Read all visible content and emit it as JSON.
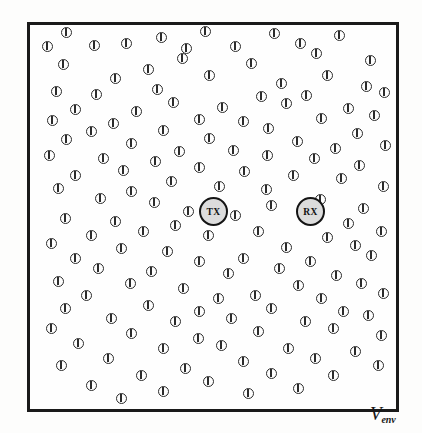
{
  "figure": {
    "name": "molecular-communication-environment-diagram",
    "background_color": "#fdfdfc",
    "box": {
      "border_color": "#1a1a1a",
      "fill_color": "#fefefe",
      "x": 27,
      "y": 22,
      "width": 372,
      "height": 390
    }
  },
  "labels": {
    "volume_symbol": "V",
    "volume_subscript": "env"
  },
  "nodes": [
    {
      "id": "tx",
      "label": "TX",
      "x": 196,
      "y": 194,
      "diameter": 29,
      "fill": "#dcdcdc",
      "stroke": "#141414"
    },
    {
      "id": "rx",
      "label": "RX",
      "x": 293,
      "y": 194,
      "diameter": 29,
      "fill": "#dcdcdc",
      "stroke": "#141414"
    }
  ],
  "particle_style": {
    "icon": "circle-with-vertical-bar",
    "diameter": 11,
    "stroke": "#2b2b2b",
    "fill": "none"
  },
  "particles": [
    [
      63,
      29
    ],
    [
      202,
      28
    ],
    [
      158,
      34
    ],
    [
      271,
      30
    ],
    [
      336,
      32
    ],
    [
      44,
      43
    ],
    [
      91,
      42
    ],
    [
      123,
      40
    ],
    [
      183,
      45
    ],
    [
      232,
      43
    ],
    [
      297,
      40
    ],
    [
      313,
      50
    ],
    [
      179,
      55
    ],
    [
      60,
      61
    ],
    [
      248,
      60
    ],
    [
      367,
      57
    ],
    [
      145,
      66
    ],
    [
      206,
      72
    ],
    [
      112,
      75
    ],
    [
      324,
      72
    ],
    [
      278,
      80
    ],
    [
      363,
      83
    ],
    [
      53,
      88
    ],
    [
      93,
      91
    ],
    [
      154,
      86
    ],
    [
      258,
      93
    ],
    [
      303,
      92
    ],
    [
      381,
      89
    ],
    [
      170,
      99
    ],
    [
      219,
      104
    ],
    [
      72,
      106
    ],
    [
      133,
      108
    ],
    [
      283,
      100
    ],
    [
      345,
      105
    ],
    [
      49,
      117
    ],
    [
      110,
      120
    ],
    [
      196,
      116
    ],
    [
      240,
      118
    ],
    [
      318,
      115
    ],
    [
      371,
      112
    ],
    [
      88,
      128
    ],
    [
      160,
      127
    ],
    [
      265,
      125
    ],
    [
      354,
      130
    ],
    [
      63,
      136
    ],
    [
      128,
      140
    ],
    [
      206,
      135
    ],
    [
      294,
      138
    ],
    [
      176,
      148
    ],
    [
      230,
      147
    ],
    [
      332,
      145
    ],
    [
      382,
      142
    ],
    [
      46,
      152
    ],
    [
      100,
      155
    ],
    [
      152,
      158
    ],
    [
      264,
      152
    ],
    [
      311,
      155
    ],
    [
      120,
      167
    ],
    [
      196,
      164
    ],
    [
      241,
      168
    ],
    [
      356,
      162
    ],
    [
      72,
      172
    ],
    [
      168,
      178
    ],
    [
      290,
      172
    ],
    [
      338,
      175
    ],
    [
      55,
      185
    ],
    [
      128,
      188
    ],
    [
      216,
      183
    ],
    [
      263,
      186
    ],
    [
      380,
      183
    ],
    [
      97,
      195
    ],
    [
      151,
      199
    ],
    [
      268,
      202
    ],
    [
      317,
      196
    ],
    [
      185,
      208
    ],
    [
      232,
      212
    ],
    [
      360,
      205
    ],
    [
      62,
      215
    ],
    [
      112,
      218
    ],
    [
      172,
      222
    ],
    [
      303,
      215
    ],
    [
      345,
      220
    ],
    [
      88,
      232
    ],
    [
      140,
      228
    ],
    [
      205,
      232
    ],
    [
      255,
      228
    ],
    [
      324,
      234
    ],
    [
      378,
      228
    ],
    [
      48,
      240
    ],
    [
      118,
      245
    ],
    [
      164,
      248
    ],
    [
      283,
      244
    ],
    [
      352,
      242
    ],
    [
      72,
      255
    ],
    [
      196,
      258
    ],
    [
      240,
      255
    ],
    [
      307,
      258
    ],
    [
      368,
      252
    ],
    [
      95,
      265
    ],
    [
      148,
      268
    ],
    [
      225,
      270
    ],
    [
      276,
      265
    ],
    [
      333,
      272
    ],
    [
      55,
      278
    ],
    [
      127,
      280
    ],
    [
      180,
      285
    ],
    [
      295,
      282
    ],
    [
      358,
      280
    ],
    [
      83,
      292
    ],
    [
      215,
      295
    ],
    [
      252,
      292
    ],
    [
      318,
      295
    ],
    [
      380,
      290
    ],
    [
      62,
      305
    ],
    [
      145,
      302
    ],
    [
      196,
      308
    ],
    [
      268,
      305
    ],
    [
      340,
      308
    ],
    [
      108,
      315
    ],
    [
      172,
      318
    ],
    [
      228,
      315
    ],
    [
      302,
      318
    ],
    [
      365,
      312
    ],
    [
      48,
      325
    ],
    [
      128,
      330
    ],
    [
      255,
      328
    ],
    [
      195,
      335
    ],
    [
      330,
      325
    ],
    [
      378,
      332
    ],
    [
      75,
      340
    ],
    [
      160,
      345
    ],
    [
      218,
      342
    ],
    [
      285,
      345
    ],
    [
      352,
      348
    ],
    [
      105,
      355
    ],
    [
      240,
      358
    ],
    [
      312,
      355
    ],
    [
      58,
      362
    ],
    [
      182,
      365
    ],
    [
      268,
      370
    ],
    [
      375,
      362
    ],
    [
      138,
      372
    ],
    [
      205,
      378
    ],
    [
      330,
      372
    ],
    [
      88,
      382
    ],
    [
      295,
      385
    ],
    [
      160,
      388
    ],
    [
      245,
      390
    ],
    [
      118,
      395
    ]
  ]
}
